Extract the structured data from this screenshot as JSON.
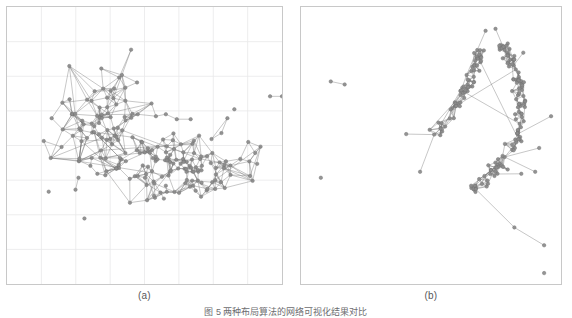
{
  "figure": {
    "caption": "图 5  两种布局算法的网络可视化结果对比",
    "background_color": "#ffffff",
    "node_color": "#8c8c8c",
    "node_stroke_color": "#6e6e6e",
    "edge_color": "#707070",
    "grid_color": "#e8e8ea",
    "border_color": "#c8c8c8"
  },
  "panels": [
    {
      "id": "a",
      "label": "(a)",
      "grid_visible": true,
      "grid_columns": 8,
      "grid_rows": 8,
      "node_count": 198,
      "edge_count": 620,
      "isolated_nodes": 6,
      "clusters": 2
    },
    {
      "id": "b",
      "label": "(b)",
      "grid_visible": false,
      "grid_columns": 0,
      "grid_rows": 0,
      "node_count": 198,
      "edge_count": 620,
      "isolated_nodes": 4,
      "clusters": 2
    }
  ],
  "chart_data": {
    "type": "scatter",
    "title": "",
    "xlabel": "",
    "ylabel": "",
    "panel_a": {
      "grid": true,
      "grid_spacing_px": 34.6,
      "clusters": [
        {
          "name": "upper-left-cluster",
          "center": [
            95,
            115
          ],
          "spread": [
            52,
            48
          ],
          "node_count": 62,
          "density": 0.16
        },
        {
          "name": "lower-right-cluster",
          "center": [
            165,
            160
          ],
          "spread": [
            72,
            34
          ],
          "node_count": 118,
          "density": 0.14
        }
      ],
      "isolated": [
        [
          265,
          90
        ],
        [
          277,
          90
        ],
        [
          229,
          103
        ],
        [
          42,
          186
        ],
        [
          78,
          213
        ],
        [
          196,
          177
        ]
      ]
    },
    "panel_b": {
      "grid": false,
      "clusters": [
        {
          "name": "upper-spine",
          "path": [
            [
              132,
              132
            ],
            [
              146,
              114
            ],
            [
              158,
              96
            ],
            [
              168,
              76
            ],
            [
              176,
              58
            ],
            [
              178,
              44
            ]
          ],
          "node_count": 62,
          "thickness": 7
        },
        {
          "name": "main-arc-spine",
          "path": [
            [
              205,
              38
            ],
            [
              214,
              58
            ],
            [
              220,
              80
            ],
            [
              222,
              104
            ],
            [
              218,
              128
            ],
            [
              206,
              152
            ],
            [
              190,
              170
            ],
            [
              172,
              184
            ]
          ],
          "node_count": 118,
          "thickness": 8
        }
      ],
      "branches": [
        {
          "from": [
            178,
            44
          ],
          "to": [
            186,
            24
          ]
        },
        {
          "from": [
            205,
            38
          ],
          "to": [
            196,
            22
          ]
        },
        {
          "from": [
            214,
            58
          ],
          "to": [
            224,
            46
          ]
        },
        {
          "from": [
            218,
            128
          ],
          "to": [
            252,
            110
          ]
        },
        {
          "from": [
            206,
            152
          ],
          "to": [
            240,
            142
          ]
        },
        {
          "from": [
            206,
            152
          ],
          "to": [
            236,
            166
          ]
        },
        {
          "from": [
            190,
            170
          ],
          "to": [
            222,
            168
          ]
        },
        {
          "from": [
            132,
            132
          ],
          "to": [
            106,
            128
          ]
        },
        {
          "from": [
            132,
            132
          ],
          "to": [
            120,
            166
          ]
        },
        {
          "from": [
            176,
            184
          ],
          "to": [
            215,
            222
          ]
        },
        {
          "from": [
            215,
            222
          ],
          "to": [
            245,
            240
          ]
        }
      ],
      "isolated": [
        [
          30,
          75
        ],
        [
          44,
          78
        ],
        [
          20,
          172
        ],
        [
          245,
          268
        ]
      ]
    }
  }
}
